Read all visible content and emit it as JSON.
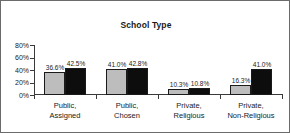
{
  "figure": {
    "title": "School Type",
    "border_color": "#6b6b6b",
    "background": "#ffffff"
  },
  "axis": {
    "y_ticks": [
      "80%",
      "60%",
      "40%",
      "20%",
      "0%"
    ]
  },
  "chart_data": {
    "type": "bar",
    "title": "School Type",
    "xlabel": "",
    "ylabel": "",
    "ylim": [
      0,
      80
    ],
    "ytick_labels": [
      "0%",
      "20%",
      "40%",
      "60%",
      "80%"
    ],
    "ytick_values": [
      0,
      20,
      40,
      60,
      80
    ],
    "grid": false,
    "legend": false,
    "categories": [
      "Public, Assigned",
      "Public, Chosen",
      "Private, Religious",
      "Private, Non-Religious"
    ],
    "category_lines": [
      [
        "Public,",
        "Assigned"
      ],
      [
        "Public,",
        "Chosen"
      ],
      [
        "Private,",
        "Religious"
      ],
      [
        "Private,",
        "Non-Religious"
      ]
    ],
    "series": [
      {
        "name": "series-a",
        "color": "#bdbdbd",
        "values": [
          36.6,
          41.0,
          10.3,
          16.3
        ],
        "labels": [
          "36.6%",
          "41.0%",
          "10.3%",
          "16.3%"
        ]
      },
      {
        "name": "series-b",
        "color": "#0d0d0d",
        "values": [
          42.5,
          42.8,
          10.8,
          41.0
        ],
        "labels": [
          "42.5%",
          "42.8%",
          "10.8%",
          "41.0%"
        ]
      }
    ]
  }
}
